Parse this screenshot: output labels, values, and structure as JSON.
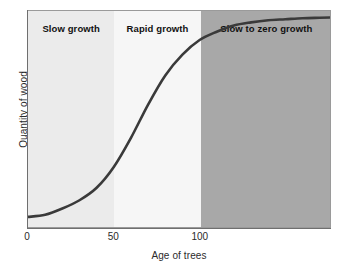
{
  "chart_data": {
    "type": "line",
    "title": "",
    "xlabel": "Age of trees",
    "ylabel": "Quantity of wood",
    "xlim": [
      0,
      176
    ],
    "ylim": [
      0,
      1
    ],
    "grid": false,
    "legend": "none",
    "xticks": [
      {
        "label": "0",
        "value": 0
      },
      {
        "label": "50",
        "value": 50
      },
      {
        "label": "100",
        "value": 100
      }
    ],
    "yticks": [],
    "series": [
      {
        "name": "Quantity of wood",
        "color": "#3a3a3a",
        "x": [
          0,
          10,
          20,
          30,
          40,
          50,
          60,
          70,
          80,
          90,
          100,
          110,
          120,
          130,
          140,
          150,
          160,
          170,
          176
        ],
        "y": [
          0.02,
          0.03,
          0.06,
          0.1,
          0.16,
          0.26,
          0.4,
          0.56,
          0.7,
          0.8,
          0.87,
          0.91,
          0.94,
          0.955,
          0.965,
          0.97,
          0.975,
          0.977,
          0.978
        ]
      }
    ],
    "regions": [
      {
        "label": "Slow growth",
        "x_start": 0,
        "x_end": 50,
        "color": "#ebebeb"
      },
      {
        "label": "Rapid growth",
        "x_start": 50,
        "x_end": 100,
        "color": "#f6f6f6"
      },
      {
        "label": "Slow to zero growth",
        "x_start": 100,
        "x_end": 176,
        "color": "#a8a8a8"
      }
    ],
    "annotations": [
      "Slow growth",
      "Rapid growth",
      "Slow to zero growth"
    ]
  },
  "colors": {
    "band_slow": "#ebebeb",
    "band_rapid": "#f6f6f6",
    "band_zero": "#a8a8a8",
    "curve": "#3a3a3a",
    "axis": "#6f6f6f",
    "frame": "#9a9a9a",
    "text": "#2b2b2b",
    "label_text": "#111111"
  }
}
